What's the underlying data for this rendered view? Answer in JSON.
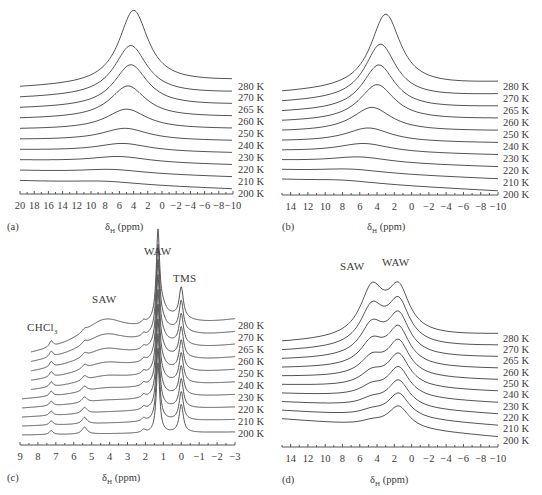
{
  "chart_data": [
    {
      "panel": "(a)",
      "type": "line",
      "title": "",
      "xlabel": "δH (ppm)",
      "xlim": [
        20,
        -10
      ],
      "xticks": [
        "20",
        "18",
        "16",
        "14",
        "12",
        "10",
        "8",
        "6",
        "4",
        "2",
        "0",
        "−2",
        "−4",
        "−6",
        "−8",
        "−10"
      ],
      "series_labels": [
        "280 K",
        "270 K",
        "265 K",
        "260 K",
        "250 K",
        "240 K",
        "230 K",
        "220 K",
        "210 K",
        "200 K"
      ],
      "peaks": [
        {
          "label": "280 K",
          "center": 4.0,
          "height": 74,
          "width": 5.0
        },
        {
          "label": "270 K",
          "center": 4.4,
          "height": 50,
          "width": 5.6
        },
        {
          "label": "265 K",
          "center": 4.4,
          "height": 42,
          "width": 5.8
        },
        {
          "label": "260 K",
          "center": 4.8,
          "height": 32,
          "width": 6.2
        },
        {
          "label": "250 K",
          "center": 5.0,
          "height": 20,
          "width": 7.0
        },
        {
          "label": "240 K",
          "center": 5.2,
          "height": 12,
          "width": 8.0
        },
        {
          "label": "230 K",
          "center": 5.5,
          "height": 8,
          "width": 9.0
        },
        {
          "label": "220 K",
          "center": 6.0,
          "height": 6,
          "width": 10.0
        },
        {
          "label": "210 K",
          "center": 7.0,
          "height": 4,
          "width": 11.0
        },
        {
          "label": "200 K",
          "center": 8.0,
          "height": 3,
          "width": 12.0
        }
      ]
    },
    {
      "panel": "(b)",
      "type": "line",
      "xlabel": "δH (ppm)",
      "xlim": [
        15,
        -10
      ],
      "xticks": [
        "14",
        "12",
        "10",
        "8",
        "6",
        "4",
        "2",
        "0",
        "−2",
        "−4",
        "−6",
        "−8",
        "−10"
      ],
      "series_labels": [
        "280 K",
        "270 K",
        "265 K",
        "260 K",
        "250 K",
        "240 K",
        "230 K",
        "220 K",
        "210 K",
        "200 K"
      ],
      "peaks": [
        {
          "label": "280 K",
          "center": 3.0,
          "height": 74,
          "width": 4.2
        },
        {
          "label": "270 K",
          "center": 3.6,
          "height": 55,
          "width": 4.4
        },
        {
          "label": "265 K",
          "center": 3.8,
          "height": 45,
          "width": 4.6
        },
        {
          "label": "260 K",
          "center": 4.0,
          "height": 36,
          "width": 5.0
        },
        {
          "label": "250 K",
          "center": 4.6,
          "height": 24,
          "width": 5.6
        },
        {
          "label": "240 K",
          "center": 5.0,
          "height": 14,
          "width": 6.4
        },
        {
          "label": "230 K",
          "center": 5.5,
          "height": 9,
          "width": 7.5
        },
        {
          "label": "220 K",
          "center": 6.0,
          "height": 6,
          "width": 8.5
        },
        {
          "label": "210 K",
          "center": 7.0,
          "height": 4,
          "width": 9.5
        },
        {
          "label": "200 K",
          "center": 8.0,
          "height": 3,
          "width": 10.0
        }
      ]
    },
    {
      "panel": "(c)",
      "type": "line",
      "xlabel": "δH (ppm)",
      "xlim": [
        9,
        -3
      ],
      "xticks": [
        "9",
        "8",
        "7",
        "6",
        "5",
        "4",
        "3",
        "2",
        "1",
        "0",
        "−1",
        "−2",
        "−3"
      ],
      "series_labels": [
        "280 K",
        "270 K",
        "265 K",
        "260 K",
        "250 K",
        "240 K",
        "230 K",
        "220 K",
        "210 K",
        "200 K"
      ],
      "annotations": [
        {
          "text": "WAW",
          "ppm": 1.3
        },
        {
          "text": "TMS",
          "ppm": 0.0
        },
        {
          "text": "SAW",
          "ppm": 4.2
        },
        {
          "text": "CHCl3",
          "ppm": 7.26
        }
      ],
      "peak_positions_ppm": {
        "CHCl3": 7.26,
        "SAW": 5.4,
        "WAW": 1.3,
        "TMS": 0.0
      }
    },
    {
      "panel": "(d)",
      "type": "line",
      "xlabel": "δH (ppm)",
      "xlim": [
        15,
        -10
      ],
      "xticks": [
        "14",
        "12",
        "10",
        "8",
        "6",
        "4",
        "2",
        "0",
        "−2",
        "−4",
        "−6",
        "−8",
        "−10"
      ],
      "series_labels": [
        "280 K",
        "270 K",
        "265 K",
        "260 K",
        "250 K",
        "240 K",
        "230 K",
        "220 K",
        "210 K",
        "200 K"
      ],
      "annotations": [
        {
          "text": "SAW",
          "ppm": 4.5
        },
        {
          "text": "WAW",
          "ppm": 1.5
        }
      ]
    }
  ],
  "panels": {
    "a": {
      "tag": "(a)",
      "xlabel_main": "δ",
      "xlabel_sub": "H",
      "xlabel_unit": " (ppm)"
    },
    "b": {
      "tag": "(b)",
      "xlabel_main": "δ",
      "xlabel_sub": "H",
      "xlabel_unit": " (ppm)"
    },
    "c": {
      "tag": "(c)",
      "xlabel_main": "δ",
      "xlabel_sub": "H",
      "xlabel_unit": " (ppm)",
      "ann_waw": "WAW",
      "ann_tms": "TMS",
      "ann_saw": "SAW",
      "ann_chcl": "CHCl",
      "ann_chcl_sub": "3"
    },
    "d": {
      "tag": "(d)",
      "xlabel_main": "δ",
      "xlabel_sub": "H",
      "xlabel_unit": " (ppm)",
      "ann_saw": "SAW",
      "ann_waw": "WAW"
    }
  }
}
